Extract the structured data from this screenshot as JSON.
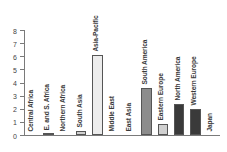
{
  "chart_data": {
    "type": "bar",
    "title": "",
    "subtitle": "",
    "xlabel": "",
    "ylabel": "",
    "ylim": [
      0,
      8
    ],
    "yticks": [
      0,
      1,
      2,
      3,
      4,
      5,
      6,
      7,
      8
    ],
    "ytick_labels": [
      "0",
      "1",
      "2",
      "3",
      "4",
      "5",
      "6",
      "7",
      "8"
    ],
    "grid": false,
    "legend": false,
    "legend_position": "none",
    "categories": [
      "Central Africa",
      "E. and S. Africa",
      "Northern Africa",
      "South Asia",
      "Asia-Pacific",
      "Middle East",
      "East Asia",
      "South America",
      "Eastern Europe",
      "North America",
      "Western Europe",
      "Japan"
    ],
    "values": [
      0.0,
      0.1,
      0.0,
      0.3,
      6.1,
      0.0,
      0.0,
      3.6,
      0.85,
      2.4,
      2.0,
      0.0
    ],
    "bar_colors": [
      "#8c8c8c",
      "#8c8c8c",
      "#8c8c8c",
      "#d0d0d0",
      "#ececec",
      "#8c8c8c",
      "#8c8c8c",
      "#8c8c8c",
      "#d0d0d0",
      "#3a3a3a",
      "#3a3a3a",
      "#3a3a3a"
    ],
    "bar_edge_color": "#555555",
    "axis_color": "#7a7a7a",
    "label_color": "#3a3a3a",
    "background": "#ffffff"
  }
}
